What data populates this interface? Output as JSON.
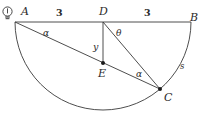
{
  "figure": {
    "background_color": "#ffffff",
    "stroke_color": "#3a3a3a",
    "label_color": "#2b2b2b",
    "icon": {
      "name": "lightbulb-icon",
      "position": {
        "x": 2,
        "y": 6
      }
    },
    "points": [
      {
        "id": "A",
        "label": "A",
        "x": 15,
        "y": 22,
        "label_x": 21,
        "label_y": 6,
        "dot": false
      },
      {
        "id": "D",
        "label": "D",
        "x": 103,
        "y": 22,
        "label_x": 99,
        "label_y": 6,
        "dot": false
      },
      {
        "id": "B",
        "label": "B",
        "x": 191,
        "y": 22,
        "label_x": 190,
        "label_y": 12,
        "dot": false
      },
      {
        "id": "E",
        "label": "E",
        "x": 103,
        "y": 63,
        "label_x": 98,
        "label_y": 68,
        "dot": true
      },
      {
        "id": "C",
        "label": "C",
        "x": 160,
        "y": 89,
        "label_x": 164,
        "label_y": 92,
        "dot": true
      }
    ],
    "segments": [
      {
        "name": "segment-AB",
        "from": "A",
        "to": "B"
      },
      {
        "name": "segment-DE",
        "from": "D",
        "to": "E"
      },
      {
        "name": "segment-AC",
        "from": "A",
        "to": "C"
      },
      {
        "name": "segment-DC",
        "from": "D",
        "to": "C"
      }
    ],
    "arc": {
      "name": "semicircle-arc",
      "center": {
        "x": 103,
        "y": 22
      },
      "radius": 88,
      "from": {
        "x": 15,
        "y": 22
      },
      "to": {
        "x": 191,
        "y": 22
      },
      "sweep": "below-diameter"
    },
    "measures": [
      {
        "name": "length-AD",
        "text": "3",
        "x": 56,
        "y": 8,
        "kind": "number"
      },
      {
        "name": "length-DB",
        "text": "3",
        "x": 144,
        "y": 8,
        "kind": "number"
      },
      {
        "name": "angle-A-alpha",
        "text": "α",
        "x": 43,
        "y": 29,
        "kind": "angle"
      },
      {
        "name": "angle-D-theta",
        "text": "θ",
        "x": 116,
        "y": 29,
        "kind": "angle"
      },
      {
        "name": "angle-C-alpha",
        "text": "α",
        "x": 136,
        "y": 70,
        "kind": "angle"
      },
      {
        "name": "length-DE-y",
        "text": "y",
        "x": 93,
        "y": 42,
        "kind": "variable"
      },
      {
        "name": "arc-length-s",
        "text": "s",
        "x": 180,
        "y": 62,
        "kind": "arc-label"
      }
    ]
  }
}
